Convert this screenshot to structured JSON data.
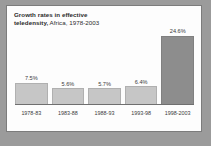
{
  "figure": {
    "title_line_1": "Growth rates in effective",
    "title_line_2_bold": "teledensity,",
    "title_line_2_rest": " Africa, 1978-2003",
    "background_color": "#9b9b9b",
    "panel_color": "#fdfdfd",
    "border_color": "#7c7c7c"
  },
  "chart_data": {
    "type": "bar",
    "title": "Growth rates in effective teledensity, Africa, 1978-2003",
    "xlabel": "",
    "ylabel": "",
    "ylim": [
      0,
      26
    ],
    "grid": false,
    "legend": null,
    "categories": [
      "1978-83",
      "1983-88",
      "1988-93",
      "1993-98",
      "1998-2003"
    ],
    "values": [
      7.5,
      5.6,
      5.7,
      6.4,
      24.6
    ],
    "value_labels": [
      "7.5%",
      "5.6%",
      "5.7%",
      "6.4%",
      "24.6%"
    ],
    "bar_colors": [
      "#c6c6c6",
      "#c6c6c6",
      "#c6c6c6",
      "#c6c6c6",
      "#8d8d8d"
    ]
  }
}
